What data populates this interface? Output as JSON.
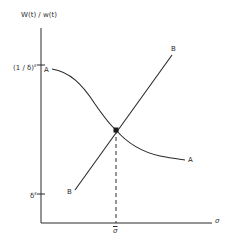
{
  "axes": {
    "y_label": "W(t) / w(t)",
    "x_label": "σ",
    "y_ticks": [
      {
        "base": "(1 / δ)",
        "exponent": "ε"
      },
      {
        "base": "δ",
        "exponent": "ε"
      }
    ],
    "x_ticks": [
      {
        "label": "σ",
        "overbar": true
      }
    ]
  },
  "curves": {
    "A": {
      "label_start": "A",
      "label_end": "A",
      "shape": "decreasing sigmoid from (1/δ)^ε toward lower asymptote"
    },
    "B": {
      "label_start": "B",
      "label_end": "B",
      "shape": "increasing straight line from near δ^ε upward"
    }
  },
  "intersection": {
    "x_label": "σ̄",
    "marker": "filled point with dashed drop line to x-axis"
  },
  "colors": {
    "ink": "#2a2a2a",
    "background": "#ffffff"
  }
}
